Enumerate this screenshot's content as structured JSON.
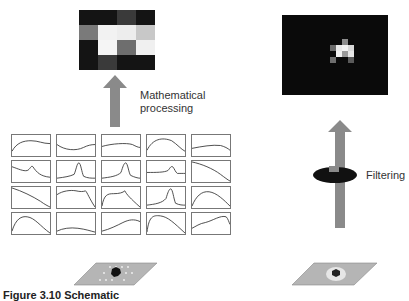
{
  "left_panel": {
    "output_image": {
      "cols": 4,
      "rows": 3,
      "pixels": [
        "#141414",
        "#141414",
        "#3a3a3a",
        "#141414",
        "#7a7a7a",
        "#f2f2f2",
        "#ededed",
        "#c8c8c8",
        "#141414",
        "#f5f5f5",
        "#6e6e6e",
        "#f0f0f0",
        "#141414",
        "#3a3a3a",
        "#141414",
        "#141414"
      ]
    },
    "arrow_label": "Mathematical processing",
    "arrow_label_line1": "Mathematical",
    "arrow_label_line2": "processing",
    "spectra_grid": {
      "cols": 5,
      "rows": 4,
      "curves": [
        "M0,17 C5,8 12,6 20,6 C28,6 32,9 40,9",
        "M0,10 C8,16 20,17 28,13 C32,11 36,10 40,10",
        "M0,12 C10,9 26,8 32,10 C36,12 38,13 40,13",
        "M0,16 C6,4 16,2 26,6 C32,10 36,15 40,17",
        "M0,14 C10,12 22,10 30,11 C34,12 38,14 40,16",
        "M0,6 C6,8 12,11 16,10 C19,9 20,4 22,6 C26,12 30,16 40,17",
        "M0,18 C8,17 14,16 18,14 C20,10 21,2 23,2 C25,2 26,12 28,16 C32,18 36,18 40,18",
        "M0,18 C8,17 16,16 20,12 C22,6 23,2 25,2 C27,2 28,12 30,15 C34,17 38,18 40,18",
        "M0,12 C10,12 18,12 22,10 C24,8 25,5 27,6 C29,8 30,12 32,13 C36,13 38,13 40,13",
        "M0,1 C10,3 22,8 30,14 C34,17 38,20 40,21",
        "M0,1 C10,4 22,10 30,15 C34,18 38,20 40,21",
        "M0,8 C6,4 14,3 20,4 C24,5 28,5 30,4 C32,6 34,12 40,21",
        "M0,20 C2,8 6,7 12,7 C18,7 22,6 24,4 C26,8 30,12 40,21",
        "M0,19 C8,18 16,17 20,12 C22,6 23,2 25,2 C27,2 28,12 30,17 C34,19 38,19 40,19",
        "M0,20 C4,10 10,4 18,5 C26,6 34,14 40,20",
        "M0,19 C4,6 10,3 16,4 C24,5 30,14 40,21",
        "M0,19 C6,16 14,15 22,16 C30,17 36,19 40,20",
        "M0,19 C8,17 16,13 22,10 C28,7 34,6 40,9",
        "M0,20 C2,4 6,2 14,3 C22,4 28,10 40,21",
        "M0,16 C4,14 8,11 14,10 C22,8 30,2 36,4 C38,6 39,10 40,12"
      ]
    },
    "sample": {
      "type": "parallelogram-sample-dotted"
    }
  },
  "right_panel": {
    "output_image": {
      "background": "#0a0a0a",
      "cluster": [
        {
          "x": 3,
          "y": 0,
          "c": "#8c8c8c"
        },
        {
          "x": 1,
          "y": 1,
          "c": "#6a6a6a"
        },
        {
          "x": 2,
          "y": 1,
          "c": "#e8e8e8"
        },
        {
          "x": 3,
          "y": 1,
          "c": "#f2f2f2"
        },
        {
          "x": 4,
          "y": 1,
          "c": "#d8d8d8"
        },
        {
          "x": 2,
          "y": 2,
          "c": "#f0f0f0"
        },
        {
          "x": 3,
          "y": 2,
          "c": "#9a9a9a"
        },
        {
          "x": 4,
          "y": 2,
          "c": "#e6e6e6"
        },
        {
          "x": 1,
          "y": 3,
          "c": "#6e6e6e"
        },
        {
          "x": 4,
          "y": 3,
          "c": "#5a5a5a"
        }
      ]
    },
    "arrow_label": "Filtering",
    "sample": {
      "type": "parallelogram-sample-halo"
    }
  },
  "caption": "Figure 3.10  Schematic",
  "colors": {
    "arrow": "#8a8a8a",
    "filter_ellipse": "#111111",
    "sample_plane": "#b5b5b5",
    "plot_border": "#777777"
  }
}
